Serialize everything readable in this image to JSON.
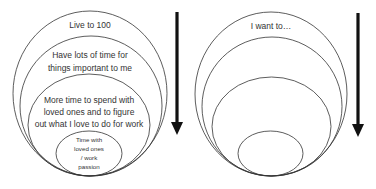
{
  "left_diagram": {
    "labels": {
      "outer": "Live to 100",
      "second_line1": "Have lots of time for",
      "second_line2": "things important to me",
      "third_line1": "More time to spend with",
      "third_line2": "loved ones and to figure",
      "third_line3": "out what I love to do for work",
      "inner_line1": "Time with",
      "inner_line2": "loved ones",
      "inner_line3": "/ work",
      "inner_line4": "passion"
    },
    "arrow": "down-arrow"
  },
  "right_diagram": {
    "labels": {
      "outer": "I want to…"
    },
    "arrow": "down-arrow"
  },
  "colors": {
    "stroke": "#333333",
    "arrow": "#111111",
    "text": "#333333"
  }
}
